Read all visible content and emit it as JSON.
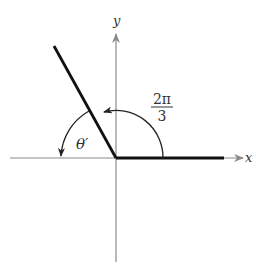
{
  "diagram": {
    "type": "reference-angle",
    "axes": {
      "x_label": "x",
      "y_label": "y",
      "axis_color": "#8a8a8a"
    },
    "angle": {
      "numerator": "2π",
      "denominator": "3",
      "description": "standard position angle 2π/3 measured counterclockwise from positive x-axis"
    },
    "reference_angle": {
      "label": "θ′",
      "description": "reference angle between terminal side and negative x-axis"
    },
    "colors": {
      "ray": "#111111",
      "arc": "#222222",
      "text": "#333333"
    }
  }
}
